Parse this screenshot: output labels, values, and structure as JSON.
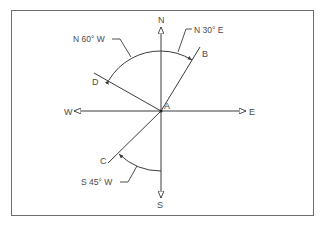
{
  "diagram": {
    "center_label": "A",
    "compass": {
      "north": "N",
      "south": "S",
      "east": "E",
      "west": "W"
    },
    "points": {
      "b": "B",
      "c": "C",
      "d": "D"
    },
    "bearings": {
      "ab": "N 30° E",
      "ad": "N 60° W",
      "ac": "S 45° W"
    },
    "colors": {
      "line": "#3c3c3c",
      "text": "#4a4a4a",
      "frame": "#6e6e6e"
    }
  }
}
